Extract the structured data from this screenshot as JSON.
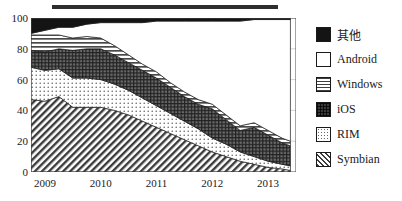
{
  "decoration": {
    "top_rule": true
  },
  "legend": {
    "position": "right",
    "entries": [
      {
        "label": "其他",
        "pattern": "solid-black",
        "swatch_name": "legend-swatch-other"
      },
      {
        "label": "Android",
        "pattern": "blank-white",
        "swatch_name": "legend-swatch-android"
      },
      {
        "label": "Windows",
        "pattern": "horizontal-lines",
        "swatch_name": "legend-swatch-windows"
      },
      {
        "label": "iOS",
        "pattern": "cross-hatch",
        "swatch_name": "legend-swatch-ios"
      },
      {
        "label": "RIM",
        "pattern": "dots",
        "swatch_name": "legend-swatch-rim"
      },
      {
        "label": "Symbian",
        "pattern": "diagonal-hatch",
        "swatch_name": "legend-swatch-symbian"
      }
    ]
  },
  "chart_data": {
    "type": "area",
    "stacked": true,
    "title": "",
    "subtitle": "",
    "xlabel": "",
    "ylabel": "",
    "xlim": [
      2008.75,
      2013.5
    ],
    "ylim": [
      0,
      100
    ],
    "yticks": [
      0,
      20,
      40,
      60,
      80,
      100
    ],
    "ytick_labels": [
      "0",
      "20",
      "40",
      "60",
      "80",
      "100"
    ],
    "xticks": [
      2009,
      2010,
      2011,
      2012,
      2013
    ],
    "xtick_labels": [
      "2009",
      "2010",
      "2011",
      "2012",
      "2013"
    ],
    "grid": "horizontal",
    "legend_position": "right",
    "x": [
      2008.75,
      2009.0,
      2009.25,
      2009.5,
      2009.75,
      2010.0,
      2010.25,
      2010.5,
      2010.75,
      2011.0,
      2011.25,
      2011.5,
      2011.75,
      2012.0,
      2012.25,
      2012.5,
      2012.75,
      2013.0,
      2013.25,
      2013.4
    ],
    "series": [
      {
        "name": "Symbian",
        "pattern": "diagonal-hatch",
        "values": [
          47,
          46,
          49,
          42,
          42,
          42,
          40,
          37,
          33,
          29,
          25,
          21,
          17,
          13,
          10,
          7,
          5,
          3,
          2,
          1
        ]
      },
      {
        "name": "RIM",
        "pattern": "dots",
        "values": [
          21,
          20,
          18,
          19,
          19,
          18,
          17,
          16,
          15,
          14,
          13,
          12,
          11,
          9,
          8,
          6,
          5,
          4,
          3,
          3
        ]
      },
      {
        "name": "iOS",
        "pattern": "cross-hatch",
        "values": [
          11,
          12,
          13,
          18,
          19,
          20,
          19,
          18,
          18,
          18,
          17,
          16,
          16,
          19,
          16,
          14,
          19,
          17,
          14,
          13
        ]
      },
      {
        "name": "Windows",
        "pattern": "horizontal-lines",
        "values": [
          10,
          11,
          9,
          8,
          8,
          7,
          6,
          5,
          4,
          4,
          3,
          3,
          3,
          3,
          3,
          3,
          3,
          3,
          3,
          3
        ]
      },
      {
        "name": "Android",
        "pattern": "blank-white",
        "values": [
          1,
          3,
          5,
          7,
          8,
          10,
          15,
          21,
          27,
          33,
          40,
          46,
          51,
          54,
          61,
          68,
          67,
          72,
          77,
          79
        ]
      },
      {
        "name": "其他",
        "pattern": "solid-black",
        "values": [
          10,
          8,
          6,
          6,
          4,
          3,
          3,
          3,
          3,
          2,
          2,
          2,
          2,
          2,
          2,
          2,
          1,
          1,
          1,
          1
        ]
      }
    ]
  }
}
